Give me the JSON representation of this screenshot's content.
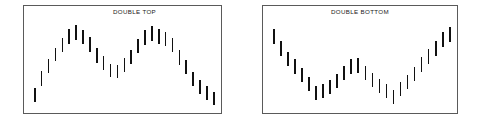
{
  "page": {
    "background_color": "#ffffff",
    "width": 482,
    "height": 128
  },
  "panels": [
    {
      "id": "double-top",
      "title": "DOUBLE TOP",
      "border_color": "#5a5a5a",
      "bar_color": "#111111"
    },
    {
      "id": "double-bottom",
      "title": "DOUBLE BOTTOM",
      "border_color": "#5a5a5a",
      "bar_color": "#111111"
    }
  ],
  "chart_data": [
    {
      "type": "bar",
      "title": "DOUBLE TOP",
      "xlabel": "",
      "ylabel": "",
      "grid": false,
      "legend": "none",
      "description": "OHLC-style vertical price range bars forming an M-shaped double top reversal pattern",
      "x": [
        1,
        2,
        3,
        4,
        5,
        6,
        7,
        8,
        9,
        10,
        11,
        12,
        13,
        14,
        15,
        16,
        17,
        18,
        19,
        20,
        21,
        22,
        23,
        24,
        25,
        26,
        27
      ],
      "ylim": [
        0,
        100
      ],
      "bars": [
        {
          "x": 1,
          "low": 6,
          "high": 22
        },
        {
          "x": 2,
          "low": 24,
          "high": 41
        },
        {
          "x": 3,
          "low": 39,
          "high": 54
        },
        {
          "x": 4,
          "low": 52,
          "high": 67
        },
        {
          "x": 5,
          "low": 62,
          "high": 78
        },
        {
          "x": 6,
          "low": 72,
          "high": 89
        },
        {
          "x": 7,
          "low": 76,
          "high": 93
        },
        {
          "x": 8,
          "low": 72,
          "high": 88
        },
        {
          "x": 9,
          "low": 63,
          "high": 79
        },
        {
          "x": 10,
          "low": 50,
          "high": 67
        },
        {
          "x": 11,
          "low": 42,
          "high": 58
        },
        {
          "x": 12,
          "low": 34,
          "high": 49
        },
        {
          "x": 13,
          "low": 33,
          "high": 48
        },
        {
          "x": 14,
          "low": 40,
          "high": 56
        },
        {
          "x": 15,
          "low": 49,
          "high": 65
        },
        {
          "x": 16,
          "low": 61,
          "high": 77
        },
        {
          "x": 17,
          "low": 70,
          "high": 87
        },
        {
          "x": 18,
          "low": 75,
          "high": 92
        },
        {
          "x": 19,
          "low": 72,
          "high": 89
        },
        {
          "x": 20,
          "low": 69,
          "high": 85
        },
        {
          "x": 21,
          "low": 62,
          "high": 78
        },
        {
          "x": 22,
          "low": 48,
          "high": 65
        },
        {
          "x": 23,
          "low": 37,
          "high": 53
        },
        {
          "x": 24,
          "low": 24,
          "high": 40
        },
        {
          "x": 25,
          "low": 15,
          "high": 31
        },
        {
          "x": 26,
          "low": 8,
          "high": 24
        },
        {
          "x": 27,
          "low": 2,
          "high": 17
        }
      ]
    },
    {
      "type": "bar",
      "title": "DOUBLE BOTTOM",
      "xlabel": "",
      "ylabel": "",
      "grid": false,
      "legend": "none",
      "description": "OHLC-style vertical price range bars forming a W-shaped double bottom reversal pattern",
      "x": [
        1,
        2,
        3,
        4,
        5,
        6,
        7,
        8,
        9,
        10,
        11,
        12,
        13,
        14,
        15,
        16,
        17,
        18,
        19,
        20,
        21,
        22,
        23,
        24,
        25,
        26
      ],
      "ylim": [
        0,
        100
      ],
      "bars": [
        {
          "x": 1,
          "low": 72,
          "high": 89
        },
        {
          "x": 2,
          "low": 58,
          "high": 75
        },
        {
          "x": 3,
          "low": 47,
          "high": 63
        },
        {
          "x": 4,
          "low": 38,
          "high": 54
        },
        {
          "x": 5,
          "low": 28,
          "high": 44
        },
        {
          "x": 6,
          "low": 18,
          "high": 34
        },
        {
          "x": 7,
          "low": 8,
          "high": 24
        },
        {
          "x": 8,
          "low": 10,
          "high": 26
        },
        {
          "x": 9,
          "low": 15,
          "high": 31
        },
        {
          "x": 10,
          "low": 22,
          "high": 38
        },
        {
          "x": 11,
          "low": 31,
          "high": 47
        },
        {
          "x": 12,
          "low": 38,
          "high": 55
        },
        {
          "x": 13,
          "low": 39,
          "high": 56
        },
        {
          "x": 14,
          "low": 31,
          "high": 47
        },
        {
          "x": 15,
          "low": 23,
          "high": 39
        },
        {
          "x": 16,
          "low": 16,
          "high": 32
        },
        {
          "x": 17,
          "low": 10,
          "high": 26
        },
        {
          "x": 18,
          "low": 3,
          "high": 19
        },
        {
          "x": 19,
          "low": 12,
          "high": 28
        },
        {
          "x": 20,
          "low": 20,
          "high": 36
        },
        {
          "x": 21,
          "low": 30,
          "high": 46
        },
        {
          "x": 22,
          "low": 40,
          "high": 57
        },
        {
          "x": 23,
          "low": 49,
          "high": 66
        },
        {
          "x": 24,
          "low": 58,
          "high": 75
        },
        {
          "x": 25,
          "low": 68,
          "high": 85
        },
        {
          "x": 26,
          "low": 74,
          "high": 91
        }
      ]
    }
  ]
}
